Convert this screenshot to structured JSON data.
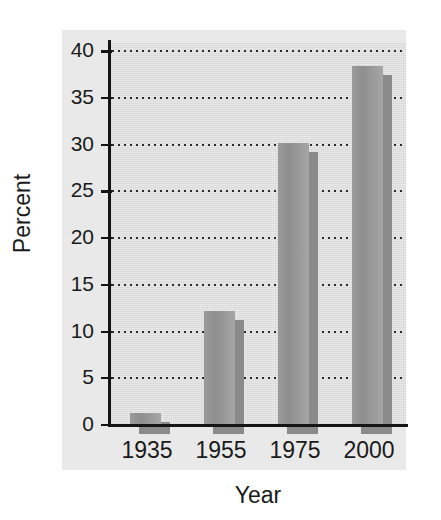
{
  "chart_data": {
    "type": "bar",
    "title": "",
    "xlabel": "Year",
    "ylabel": "Percent",
    "categories": [
      "1935",
      "1955",
      "1975",
      "2000"
    ],
    "values": [
      1.3,
      12.2,
      30.2,
      38.4
    ],
    "ylim": [
      0,
      41
    ],
    "yticks": [
      0,
      5,
      10,
      15,
      20,
      25,
      30,
      35,
      40
    ],
    "ytick_labels": [
      "0",
      "5",
      "10",
      "15",
      "20",
      "25",
      "30",
      "35",
      "40"
    ],
    "grid": true,
    "grid_style": "dotted-horizontal",
    "legend": null,
    "bar_color": "#989898",
    "shadow_color": "#8a8a8a",
    "plot_background": "#dcdcdc",
    "figure_background": "#ffffff"
  },
  "axes": {
    "y_title": "Percent",
    "x_title": "Year"
  }
}
